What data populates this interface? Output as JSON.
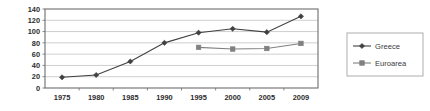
{
  "chart_data": {
    "type": "line",
    "title": "",
    "subtitle": "",
    "xlabel": "",
    "ylabel": "",
    "x": [
      "1975",
      "1980",
      "1985",
      "1990",
      "1995",
      "2000",
      "2005",
      "2009"
    ],
    "categories": [
      "1975",
      "1980",
      "1985",
      "1990",
      "1995",
      "2000",
      "2005",
      "2009"
    ],
    "xtick_labels": [
      "1975",
      "1980",
      "1985",
      "1990",
      "1995",
      "2000",
      "2009"
    ],
    "ytick_labels": [
      "140",
      "120",
      "100",
      "80",
      "60",
      "40",
      "20",
      "0"
    ],
    "ylim": [
      0,
      140
    ],
    "ytick_step": 20,
    "grid": "horizontal",
    "legend_position": "right",
    "series": [
      {
        "name": "Greece",
        "color": "#404040",
        "marker": "diamond",
        "values": [
          19,
          23,
          47,
          80,
          98,
          105,
          99,
          127
        ]
      },
      {
        "name": "Euroarea",
        "color": "#808080",
        "marker": "square",
        "values": [
          null,
          null,
          null,
          null,
          72,
          69,
          70,
          79
        ]
      }
    ]
  },
  "axis": {
    "y_ticks": [
      "140",
      "120",
      "100",
      "80",
      "60",
      "40",
      "20",
      "0"
    ],
    "x_ticks": [
      "1975",
      "1980",
      "1985",
      "1990",
      "1995",
      "2000",
      "2005",
      "2009"
    ]
  },
  "legend": {
    "entries": [
      {
        "label": "Greece"
      },
      {
        "label": "Euroarea"
      }
    ]
  },
  "colors": {
    "greece": "#404040",
    "euroarea": "#808080",
    "grid": "#b9b9b9",
    "frame": "#6d6d6d",
    "background": "#ffffff"
  }
}
